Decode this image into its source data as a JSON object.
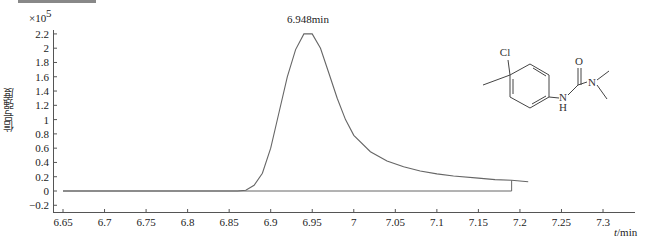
{
  "chart_data": {
    "type": "line",
    "title": "",
    "xlabel": "t/min",
    "ylabel": "信号强度",
    "y_multiplier": "×10^5",
    "xlim": [
      6.64,
      7.34
    ],
    "ylim": [
      -0.2,
      2.2
    ],
    "x_ticks": [
      "6.65",
      "6.7",
      "6.75",
      "6.8",
      "6.85",
      "6.9",
      "6.95",
      "7",
      "7.05",
      "7.1",
      "7.15",
      "7.2",
      "7.25",
      "7.3"
    ],
    "y_ticks": [
      "-0.2",
      "0",
      "0.2",
      "0.4",
      "0.6",
      "0.8",
      "1",
      "1.2",
      "1.4",
      "1.6",
      "1.8",
      "2",
      "2.2"
    ],
    "grid": false,
    "annotation": "6.948min",
    "series": [
      {
        "name": "chromatogram",
        "x": [
          6.65,
          6.86,
          6.87,
          6.88,
          6.89,
          6.9,
          6.91,
          6.92,
          6.93,
          6.94,
          6.95,
          6.96,
          6.97,
          6.98,
          6.99,
          7.0,
          7.02,
          7.04,
          7.06,
          7.08,
          7.1,
          7.12,
          7.15,
          7.17,
          7.19,
          7.21
        ],
        "values": [
          0,
          0,
          0.01,
          0.08,
          0.25,
          0.6,
          1.1,
          1.6,
          1.98,
          2.2,
          2.2,
          2.0,
          1.65,
          1.3,
          1.0,
          0.78,
          0.55,
          0.42,
          0.34,
          0.28,
          0.24,
          0.21,
          0.18,
          0.16,
          0.15,
          0.13
        ]
      }
    ],
    "baseline": {
      "x_start": 6.65,
      "x_end": 7.19,
      "value": 0
    }
  },
  "labels": {
    "y_multiplier": "×10",
    "y_exponent": "5",
    "ylabel": "信号强度",
    "xlabel_italic": "t",
    "xlabel_unit": "/min",
    "peak_annotation": "6.948min"
  },
  "molecule": {
    "atoms": [
      "Cl",
      "O",
      "N",
      "N",
      "H"
    ]
  }
}
